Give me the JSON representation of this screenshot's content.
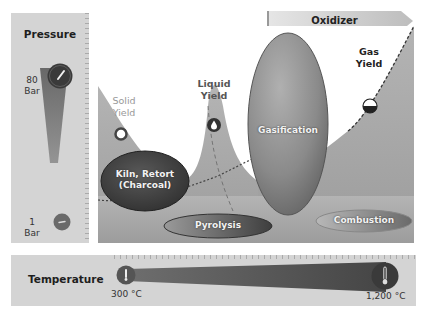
{
  "pressure": {
    "title": "Pressure",
    "high": {
      "value": "80",
      "unit": "Bar"
    },
    "low": {
      "value": "1",
      "unit": "Bar"
    }
  },
  "temperature": {
    "title": "Temperature",
    "low": "300 °C",
    "high": "1,200 °C"
  },
  "oxidizer": {
    "label": "Oxidizer"
  },
  "yields": {
    "solid": {
      "line1": "Solid",
      "line2": "Yield"
    },
    "liquid": {
      "line1": "Liquid",
      "line2": "Yield"
    },
    "gas": {
      "line1": "Gas",
      "line2": "Yield"
    }
  },
  "processes": {
    "kiln": {
      "line1": "Kiln, Retort",
      "line2": "(Charcoal)"
    },
    "pyrolysis": "Pyrolysis",
    "gasification": "Gasification",
    "combustion": "Combustion"
  },
  "colors": {
    "panel_bg": "#d4d4d4",
    "area_fill": "#a8a8a8",
    "dark_ellipse": "#3c3c3c",
    "gasification_ellipse": "#8a8a8a"
  }
}
